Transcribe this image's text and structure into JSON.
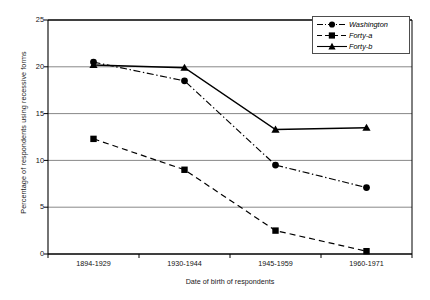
{
  "chart_data": {
    "type": "line",
    "title": "",
    "xlabel": "Date of birth of respondents",
    "ylabel": "Percentage of respondents using recessive forms",
    "categories": [
      "1894-1929",
      "1930-1944",
      "1945-1959",
      "1960-1971"
    ],
    "ylim": [
      0,
      25
    ],
    "yticks": [
      0,
      5,
      10,
      15,
      20,
      25
    ],
    "ytick_labels": [
      "0",
      "5",
      "10",
      "15",
      "20",
      "25"
    ],
    "grid": "horizontal",
    "legend_position": "top-right",
    "series": [
      {
        "name": "Washington",
        "marker": "circle",
        "line_style": "dash-dot",
        "color": "#000000",
        "values": [
          20.5,
          18.5,
          9.5,
          7.1
        ]
      },
      {
        "name": "Forty-a",
        "marker": "square",
        "line_style": "dashed",
        "color": "#000000",
        "values": [
          12.3,
          9.0,
          2.5,
          0.3
        ]
      },
      {
        "name": "Forty-b",
        "marker": "triangle",
        "line_style": "solid",
        "color": "#000000",
        "values": [
          20.2,
          19.9,
          13.3,
          13.5
        ]
      }
    ]
  },
  "legend": {
    "items": [
      {
        "label": "Washington"
      },
      {
        "label": "Forty-a"
      },
      {
        "label": "Forty-b"
      }
    ]
  },
  "caption": {
    "text": ""
  }
}
